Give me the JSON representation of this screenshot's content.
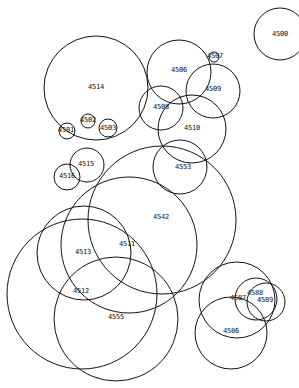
{
  "diagram": {
    "type": "overlapping-circles",
    "stroke_color": "#111111",
    "background_color": "#ffffff",
    "circles": [
      {
        "label": "4500",
        "cx": 280,
        "cy": 34,
        "r": 26,
        "lx": 280,
        "ly": 34
      },
      {
        "label": "4514",
        "cx": 96,
        "cy": 88,
        "r": 52,
        "lx": 96,
        "ly": 87
      },
      {
        "label": "4506",
        "cx": 179,
        "cy": 72,
        "r": 32,
        "lx": 179,
        "ly": 70
      },
      {
        "label": "4507",
        "cx": 214,
        "cy": 57,
        "r": 5,
        "lx": 215,
        "ly": 56
      },
      {
        "label": "4509",
        "cx": 213,
        "cy": 91,
        "r": 27,
        "lx": 213,
        "ly": 89
      },
      {
        "label": "4508",
        "cx": 161,
        "cy": 108,
        "r": 22,
        "lx": 161,
        "ly": 107
      },
      {
        "label": "4510",
        "cx": 192,
        "cy": 129,
        "r": 34,
        "lx": 192,
        "ly": 128
      },
      {
        "label": "4502",
        "cx": 88,
        "cy": 121,
        "r": 7,
        "lx": 88,
        "ly": 120
      },
      {
        "label": "4501",
        "cx": 67,
        "cy": 131,
        "r": 8,
        "lx": 66,
        "ly": 130
      },
      {
        "label": "4503",
        "cx": 108,
        "cy": 128,
        "r": 9,
        "lx": 108,
        "ly": 128
      },
      {
        "label": "4553",
        "cx": 180,
        "cy": 167,
        "r": 27,
        "lx": 183,
        "ly": 167
      },
      {
        "label": "4515",
        "cx": 87,
        "cy": 165,
        "r": 17,
        "lx": 86,
        "ly": 164
      },
      {
        "label": "4516",
        "cx": 67,
        "cy": 177,
        "r": 13,
        "lx": 67,
        "ly": 176
      },
      {
        "label": "4542",
        "cx": 162,
        "cy": 220,
        "r": 74,
        "lx": 161,
        "ly": 217
      },
      {
        "label": "4511",
        "cx": 129,
        "cy": 245,
        "r": 68,
        "lx": 127,
        "ly": 244
      },
      {
        "label": "4513",
        "cx": 84,
        "cy": 253,
        "r": 47,
        "lx": 83,
        "ly": 252
      },
      {
        "label": "4512",
        "cx": 82,
        "cy": 294,
        "r": 75,
        "lx": 81,
        "ly": 291
      },
      {
        "label": "4555",
        "cx": 116,
        "cy": 319,
        "r": 62,
        "lx": 116,
        "ly": 317
      },
      {
        "label": "4587",
        "cx": 237,
        "cy": 300,
        "r": 38,
        "lx": 238,
        "ly": 298
      },
      {
        "label": "4586",
        "cx": 231,
        "cy": 333,
        "r": 36,
        "lx": 231,
        "ly": 331
      },
      {
        "label": "4588",
        "cx": 256,
        "cy": 299,
        "r": 21,
        "lx": 255,
        "ly": 293
      },
      {
        "label": "4589",
        "cx": 266,
        "cy": 302,
        "r": 19,
        "lx": 265,
        "ly": 300
      }
    ]
  }
}
